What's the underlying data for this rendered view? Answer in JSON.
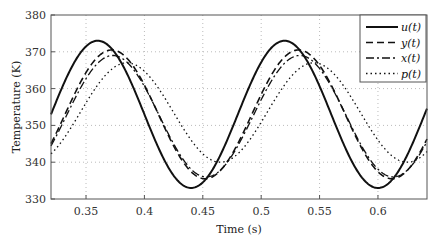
{
  "chart_data": {
    "type": "line",
    "title": "",
    "xlabel": "Time (s)",
    "ylabel": "Temperature (K)",
    "xlim": [
      0.32,
      0.642
    ],
    "ylim": [
      330,
      380
    ],
    "xticks": [
      0.35,
      0.4,
      0.45,
      0.5,
      0.55,
      0.6
    ],
    "xtick_labels": [
      "0.35",
      "0.4",
      "0.45",
      "0.5",
      "0.55",
      "0.6"
    ],
    "yticks": [
      330,
      340,
      350,
      360,
      370,
      380
    ],
    "ytick_labels": [
      "330",
      "340",
      "350",
      "360",
      "370",
      "380"
    ],
    "grid": true,
    "legend_position": "top-right",
    "period": 0.16,
    "series": [
      {
        "name": "u(t)",
        "style": "solid",
        "mean": 353,
        "amplitude": 20,
        "peak_time": 0.36
      },
      {
        "name": "y(t)",
        "style": "dashed",
        "mean": 353,
        "amplitude": 17.5,
        "peak_time": 0.372
      },
      {
        "name": "x(t)",
        "style": "dashdot",
        "mean": 352.5,
        "amplitude": 16.5,
        "peak_time": 0.373
      },
      {
        "name": "p(t)",
        "style": "dotted",
        "mean": 353.5,
        "amplitude": 13.5,
        "peak_time": 0.385
      }
    ]
  }
}
